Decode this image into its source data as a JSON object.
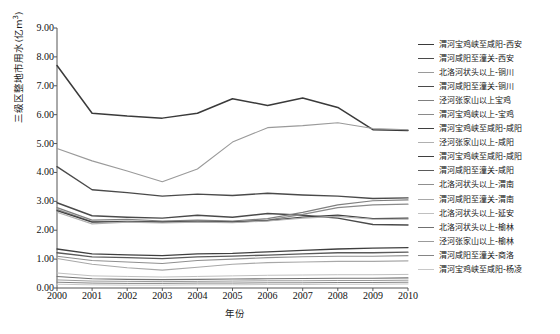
{
  "chart_data": {
    "type": "line",
    "title": "",
    "xlabel": "年份",
    "ylabel": "三级区整地市用水(亿m³)",
    "ylabel_unit": "亿m³",
    "xlim": [
      2000,
      2010
    ],
    "ylim": [
      0.0,
      9.0
    ],
    "ytick_step": 1.0,
    "grid": false,
    "legend_position": "right",
    "x": [
      2000,
      2001,
      2002,
      2003,
      2004,
      2005,
      2006,
      2007,
      2008,
      2009,
      2010
    ],
    "xticklabels": [
      "2000",
      "2001",
      "2002",
      "2003",
      "2004",
      "2005",
      "2006",
      "2007",
      "2008",
      "2009",
      "2010"
    ],
    "yticklabels": [
      "0.00",
      "1.00",
      "2.00",
      "3.00",
      "4.00",
      "5.00",
      "6.00",
      "7.00",
      "8.00",
      "9.00"
    ],
    "series": [
      {
        "name": "渭河宝鸡峡至咸阳-西安",
        "color": "#3a3a3a",
        "width": 1.5,
        "values": [
          7.7,
          6.05,
          5.95,
          5.88,
          6.05,
          6.55,
          6.32,
          6.58,
          6.25,
          5.48,
          5.45
        ]
      },
      {
        "name": "渭河咸阳至潼关-西安",
        "color": "#4a4a4a",
        "width": 1.4,
        "values": [
          4.2,
          3.4,
          3.3,
          3.18,
          3.25,
          3.2,
          3.28,
          3.22,
          3.18,
          3.1,
          3.12
        ]
      },
      {
        "name": "北洛河状头以上-铜川",
        "color": "#9a9a9a",
        "width": 1.1,
        "values": [
          4.83,
          4.4,
          4.05,
          3.68,
          4.12,
          5.05,
          5.55,
          5.62,
          5.72,
          5.52,
          5.48
        ]
      },
      {
        "name": "渭河咸阳至潼关-铜川",
        "color": "#4a4a4a",
        "width": 1.4,
        "values": [
          2.95,
          2.5,
          2.45,
          2.42,
          2.52,
          2.45,
          2.58,
          2.52,
          2.42,
          2.2,
          2.18
        ]
      },
      {
        "name": "泾河张家山以上宝鸡",
        "color": "#7f7f7f",
        "width": 1.2,
        "values": [
          2.78,
          2.35,
          2.38,
          2.32,
          2.35,
          2.32,
          2.4,
          2.62,
          2.88,
          3.02,
          3.05
        ]
      },
      {
        "name": "渭河宝鸡峡以上-宝鸡",
        "color": "#8a8a8a",
        "width": 1.2,
        "values": [
          2.72,
          2.3,
          2.32,
          2.3,
          2.32,
          2.3,
          2.35,
          2.55,
          2.78,
          2.88,
          2.9
        ]
      },
      {
        "name": "渭河宝鸡峡至咸阳-咸阳",
        "color": "#3f3f3f",
        "width": 1.3,
        "values": [
          2.68,
          2.28,
          2.3,
          2.28,
          2.3,
          2.28,
          2.33,
          2.45,
          2.52,
          2.4,
          2.42
        ]
      },
      {
        "name": "泾河张家山以上-咸阳",
        "color": "#b0b0b0",
        "width": 1.1,
        "values": [
          2.62,
          2.22,
          2.28,
          2.25,
          2.28,
          2.26,
          2.32,
          2.42,
          2.48,
          2.38,
          2.38
        ]
      },
      {
        "name": "渭河宝鸡峡至咸阳-咸阳",
        "color": "#3f3f3f",
        "width": 1.3,
        "values": [
          1.35,
          1.18,
          1.15,
          1.12,
          1.18,
          1.2,
          1.25,
          1.3,
          1.35,
          1.38,
          1.4
        ]
      },
      {
        "name": "渭河咸阳至潼关-咸阳",
        "color": "#5a5a5a",
        "width": 1.3,
        "values": [
          1.22,
          1.08,
          1.05,
          1.02,
          1.08,
          1.1,
          1.14,
          1.18,
          1.22,
          1.22,
          1.24
        ]
      },
      {
        "name": "北洛河状头以上-渭南",
        "color": "#8f8f8f",
        "width": 1.1,
        "values": [
          1.1,
          0.95,
          0.9,
          0.85,
          0.95,
          1.0,
          1.05,
          1.08,
          1.1,
          1.1,
          1.12
        ]
      },
      {
        "name": "渭河咸阳至潼关-渭南",
        "color": "#a8a8a8",
        "width": 1.1,
        "values": [
          1.02,
          0.82,
          0.7,
          0.62,
          0.72,
          0.82,
          0.88,
          0.9,
          0.92,
          0.92,
          0.94
        ]
      },
      {
        "name": "北洛河状头以上-延安",
        "color": "#c0c0c0",
        "width": 1.0,
        "values": [
          0.52,
          0.42,
          0.4,
          0.38,
          0.4,
          0.42,
          0.44,
          0.45,
          0.46,
          0.46,
          0.47
        ]
      },
      {
        "name": "北洛河状头以上-榆林",
        "color": "#707070",
        "width": 1.1,
        "values": [
          0.4,
          0.32,
          0.3,
          0.29,
          0.3,
          0.31,
          0.32,
          0.33,
          0.34,
          0.34,
          0.35
        ]
      },
      {
        "name": "泾河张家山以上-榆林",
        "color": "#9b9b9b",
        "width": 1.0,
        "values": [
          0.28,
          0.24,
          0.23,
          0.22,
          0.23,
          0.24,
          0.25,
          0.25,
          0.26,
          0.26,
          0.27
        ]
      },
      {
        "name": "渭河咸阳至潼关-商洛",
        "color": "#858585",
        "width": 1.0,
        "values": [
          0.2,
          0.17,
          0.16,
          0.16,
          0.17,
          0.17,
          0.18,
          0.18,
          0.19,
          0.19,
          0.2
        ]
      },
      {
        "name": "渭河宝鸡峡至咸阳-杨凌",
        "color": "#c8c8c8",
        "width": 1.0,
        "values": [
          0.13,
          0.11,
          0.1,
          0.1,
          0.11,
          0.11,
          0.12,
          0.12,
          0.13,
          0.13,
          0.14
        ]
      }
    ]
  },
  "axis": {
    "y_title_main": "三级区整地市用水(亿m",
    "y_title_sup": "3",
    "y_title_tail": ")",
    "x_title": "年份"
  }
}
